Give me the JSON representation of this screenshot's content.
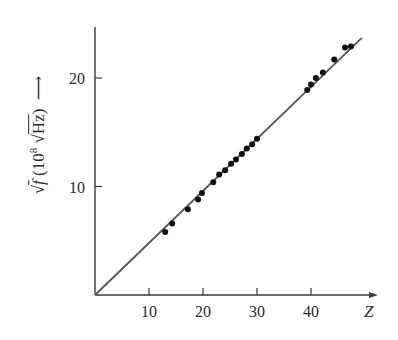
{
  "chart_data": {
    "type": "scatter",
    "title": "",
    "xlabel": "Z",
    "ylabel": "√f (10^8 √Hz)",
    "ylabel_parts": {
      "root": "√",
      "f": "f",
      "unit_open": "(10",
      "exp": "8",
      "unit_root": "√",
      "unit": "Hz",
      "unit_close": ")"
    },
    "xlim": [
      0,
      52
    ],
    "ylim": [
      0,
      25
    ],
    "xticks": [
      10,
      20,
      30,
      40
    ],
    "yticks": [
      10,
      20
    ],
    "xtick_labels": [
      "10",
      "20",
      "30",
      "40"
    ],
    "ytick_labels": [
      "10",
      "20"
    ],
    "grid": false,
    "legend": null,
    "fit_line": {
      "x": [
        0,
        49.4
      ],
      "y": [
        0,
        23.7
      ]
    },
    "series": [
      {
        "name": "measurements",
        "x": [
          13.0,
          14.3,
          17.2,
          19.1,
          19.8,
          21.9,
          23.0,
          24.1,
          25.2,
          26.1,
          27.2,
          28.1,
          29.1,
          30.0,
          39.3,
          40.0,
          40.9,
          42.2,
          44.3,
          46.3,
          47.4
        ],
        "y": [
          5.8,
          6.6,
          7.9,
          8.8,
          9.4,
          10.4,
          11.1,
          11.5,
          12.1,
          12.5,
          13.0,
          13.5,
          13.9,
          14.4,
          18.9,
          19.4,
          20.0,
          20.5,
          21.7,
          22.8,
          22.9
        ]
      }
    ]
  },
  "colors": {
    "axis": "#3a3a3a",
    "line": "#555555",
    "points": "#111111"
  }
}
